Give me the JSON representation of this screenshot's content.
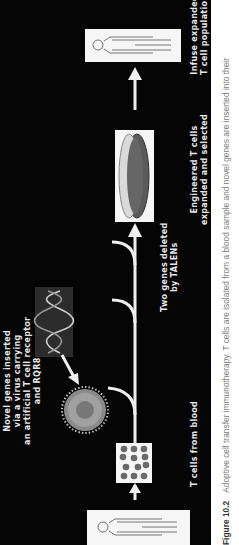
{
  "figure": {
    "number": "Figure 10.2",
    "caption": "Adoptive cell transfer immunotherapy. T cells are isolated from a blood sample and novel genes are inserted into their"
  },
  "steps": [
    {
      "id": "patient",
      "label_lines": [
        "",
        ""
      ]
    },
    {
      "id": "t-cells",
      "label_lines": [
        "T cells from blood"
      ]
    },
    {
      "id": "gene-insertion",
      "label_lines": [
        "Novel genes inserted",
        "via a virus carrying",
        "an artificial T cell receptor",
        "and RQR8"
      ]
    },
    {
      "id": "gene-deletion",
      "label_lines": [
        "Two genes deleted",
        "by TALENs"
      ]
    },
    {
      "id": "expansion",
      "label_lines": [
        "Engineered T cells",
        "expanded and selected"
      ]
    },
    {
      "id": "infusion",
      "label_lines": [
        "Infuse expanded",
        "T cell population"
      ]
    }
  ],
  "colors": {
    "background": "#050505",
    "foreground": "#f0f0f0",
    "cell": "#6a6a6a",
    "caption": "#7a7a7a"
  }
}
